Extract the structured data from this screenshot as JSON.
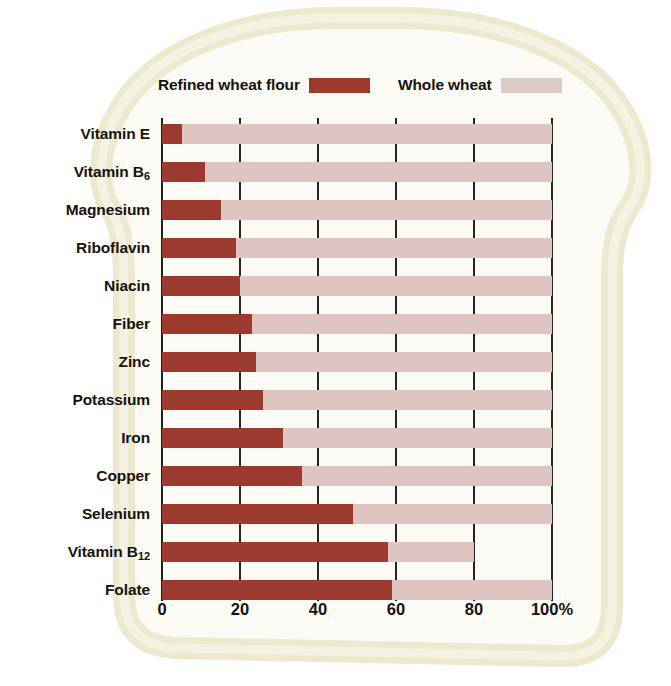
{
  "legend": {
    "items": [
      {
        "label": "Refined wheat flour",
        "swatch": "refined",
        "color": "#9c3a30"
      },
      {
        "label": "Whole wheat",
        "swatch": "whole",
        "color": "#dfc5c1"
      }
    ]
  },
  "axis": {
    "ticks": [
      "0",
      "20",
      "40",
      "60",
      "80",
      "100%"
    ],
    "tick_values": [
      0,
      20,
      40,
      60,
      80,
      100
    ]
  },
  "chart_data": {
    "type": "bar",
    "orientation": "horizontal",
    "stacked": true,
    "title": "",
    "subtitle": "",
    "xlabel": "",
    "ylabel": "",
    "xlim": [
      0,
      100
    ],
    "grid": true,
    "legend_position": "top",
    "units": "percent",
    "categories": [
      "Vitamin E",
      "Vitamin B6",
      "Magnesium",
      "Riboflavin",
      "Niacin",
      "Fiber",
      "Zinc",
      "Potassium",
      "Iron",
      "Copper",
      "Selenium",
      "Vitamin B12",
      "Folate"
    ],
    "category_labels": [
      {
        "text": "Vitamin E",
        "sub": ""
      },
      {
        "text": "Vitamin B",
        "sub": "6"
      },
      {
        "text": "Magnesium",
        "sub": ""
      },
      {
        "text": "Riboflavin",
        "sub": ""
      },
      {
        "text": "Niacin",
        "sub": ""
      },
      {
        "text": "Fiber",
        "sub": ""
      },
      {
        "text": "Zinc",
        "sub": ""
      },
      {
        "text": "Potassium",
        "sub": ""
      },
      {
        "text": "Iron",
        "sub": ""
      },
      {
        "text": "Copper",
        "sub": ""
      },
      {
        "text": "Selenium",
        "sub": ""
      },
      {
        "text": "Vitamin B",
        "sub": "12"
      },
      {
        "text": "Folate",
        "sub": ""
      }
    ],
    "series": [
      {
        "name": "Refined wheat flour",
        "color": "#9c3a30",
        "values": [
          5,
          11,
          15,
          19,
          20,
          23,
          24,
          26,
          31,
          36,
          49,
          58,
          59
        ]
      },
      {
        "name": "Whole wheat",
        "color": "#dfc5c1",
        "values": [
          100,
          100,
          100,
          100,
          100,
          100,
          100,
          100,
          100,
          100,
          100,
          80,
          100
        ]
      }
    ]
  },
  "colors": {
    "refined": "#9c3a30",
    "whole": "#dfc5c1",
    "bread_crust": "#ece9cf",
    "bread_inner": "#fbfaf4",
    "axis": "#231f1c",
    "text": "#17120f"
  }
}
